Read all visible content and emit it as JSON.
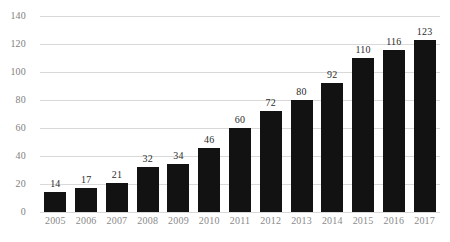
{
  "chart_data": {
    "type": "bar",
    "title": "",
    "subtitle": "",
    "xlabel": "",
    "ylabel": "",
    "categories": [
      "2005",
      "2006",
      "2007",
      "2008",
      "2009",
      "2010",
      "2011",
      "2012",
      "2013",
      "2014",
      "2015",
      "2016",
      "2017"
    ],
    "values": [
      14,
      17,
      21,
      32,
      34,
      46,
      60,
      72,
      80,
      92,
      110,
      116,
      123
    ],
    "data_labels": [
      "14",
      "17",
      "21",
      "32",
      "34",
      "46",
      "60",
      "72",
      "80",
      "92",
      "110",
      "116",
      "123"
    ],
    "ylim": [
      0,
      140
    ],
    "yticks": [
      0,
      20,
      40,
      60,
      80,
      100,
      120,
      140
    ],
    "ytick_labels": [
      "0",
      "20",
      "40",
      "60",
      "80",
      "100",
      "120",
      "140"
    ],
    "grid": true,
    "grid_axis": "y",
    "legend": null,
    "legend_position": "none",
    "colors": {
      "bar": "#121212",
      "gridline": "#d9d9d9",
      "background": "#ffffff",
      "ytick_text": "#808080",
      "xtick_text": "#8a8a8a",
      "data_label_text": "#2b2b2b"
    }
  }
}
